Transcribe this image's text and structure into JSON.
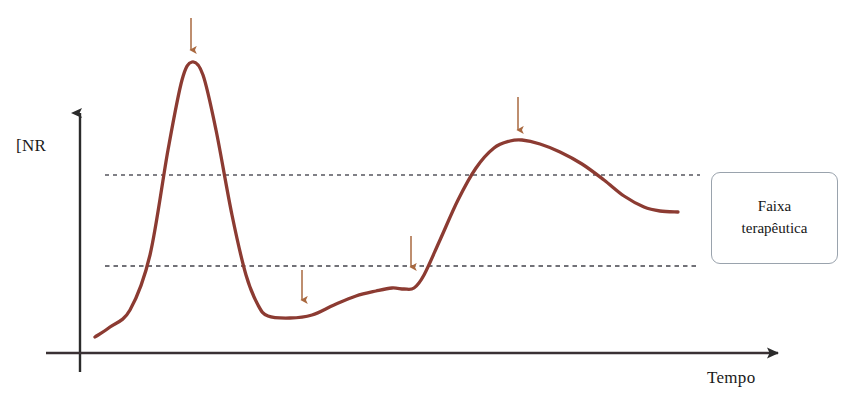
{
  "figure": {
    "width": 855,
    "height": 416,
    "background": "#ffffff"
  },
  "axes": {
    "y_label": "[NR",
    "x_label": "Tempo",
    "axis_color": "#2b2b2b",
    "origin_x": 80,
    "origin_y": 353,
    "y_axis_top": 105,
    "x_axis_right": 790
  },
  "legend": {
    "line1": "Faixa",
    "line2": "terapêutica",
    "border_color": "#9aa3ad",
    "background": "#ffffff"
  },
  "chart_data": {
    "type": "line",
    "title": "",
    "xlabel": "Tempo",
    "ylabel": "[NR",
    "curve_color": "#8c3b32",
    "arrow_color": "#a9683f",
    "band_line_color": "#4a4a52",
    "grid": false,
    "legend_position": "right",
    "therapeutic_range": {
      "label": "Faixa terapêutica",
      "upper_y_px": 175,
      "lower_y_px": 266,
      "x_start_px": 105,
      "x_end_px": 700,
      "style": "dotted"
    },
    "series": [
      {
        "name": "INR",
        "points_px": [
          [
            95,
            337
          ],
          [
            110,
            327
          ],
          [
            130,
            310
          ],
          [
            150,
            255
          ],
          [
            168,
            150
          ],
          [
            182,
            80
          ],
          [
            192,
            62
          ],
          [
            203,
            75
          ],
          [
            216,
            130
          ],
          [
            232,
            215
          ],
          [
            246,
            275
          ],
          [
            258,
            305
          ],
          [
            268,
            316
          ],
          [
            290,
            318
          ],
          [
            312,
            315
          ],
          [
            334,
            305
          ],
          [
            356,
            296
          ],
          [
            376,
            291
          ],
          [
            392,
            288
          ],
          [
            404,
            289
          ],
          [
            414,
            288
          ],
          [
            424,
            275
          ],
          [
            440,
            240
          ],
          [
            458,
            200
          ],
          [
            476,
            168
          ],
          [
            494,
            148
          ],
          [
            510,
            141
          ],
          [
            522,
            140
          ],
          [
            540,
            144
          ],
          [
            560,
            152
          ],
          [
            582,
            164
          ],
          [
            604,
            180
          ],
          [
            624,
            196
          ],
          [
            644,
            207
          ],
          [
            660,
            211
          ],
          [
            678,
            212
          ]
        ]
      }
    ],
    "annotations": [
      {
        "type": "arrow-down",
        "name": "dose-event-1",
        "x_px": 191,
        "y_start_px": 18,
        "y_end_px": 50
      },
      {
        "type": "arrow-down",
        "name": "dose-event-2",
        "x_px": 302,
        "y_start_px": 270,
        "y_end_px": 300
      },
      {
        "type": "arrow-down",
        "name": "dose-event-3",
        "x_px": 411,
        "y_start_px": 236,
        "y_end_px": 267
      },
      {
        "type": "arrow-down",
        "name": "dose-event-4",
        "x_px": 518,
        "y_start_px": 97,
        "y_end_px": 130
      }
    ]
  }
}
